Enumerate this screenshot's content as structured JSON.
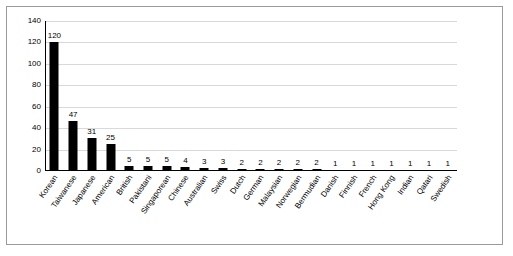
{
  "chart_data": {
    "type": "bar",
    "title": "",
    "subtitle": "",
    "xlabel": "",
    "ylabel": "",
    "grid": true,
    "legend": false,
    "ylim": [
      0,
      140
    ],
    "yticks": [
      0,
      20,
      40,
      60,
      80,
      100,
      120,
      140
    ],
    "ytick_labels": [
      "0",
      "20",
      "40",
      "60",
      "80",
      "100",
      "120",
      "140"
    ],
    "categories": [
      "Korean",
      "Taiwanese",
      "Japanese",
      "American",
      "British",
      "Pakistani",
      "Singaporean",
      "Chinese",
      "Australian",
      "Swiss",
      "Dutch",
      "German",
      "Malaysian",
      "Norwegian",
      "Bermudian",
      "Danish",
      "Finnish",
      "French",
      "Hong Kong",
      "Indian",
      "Qatari",
      "Swedish"
    ],
    "values": [
      120,
      47,
      31,
      25,
      5,
      5,
      5,
      4,
      3,
      3,
      2,
      2,
      2,
      2,
      2,
      1,
      1,
      1,
      1,
      1,
      1,
      1
    ],
    "data_labels": [
      "120",
      "47",
      "31",
      "25",
      "5",
      "5",
      "5",
      "4",
      "3",
      "3",
      "2",
      "2",
      "2",
      "2",
      "2",
      "1",
      "1",
      "1",
      "1",
      "1",
      "1",
      "1"
    ],
    "bar_color": "#000000",
    "grid_color": "#d9d9d9",
    "axis_color": "#000000",
    "background": "#ffffff"
  }
}
